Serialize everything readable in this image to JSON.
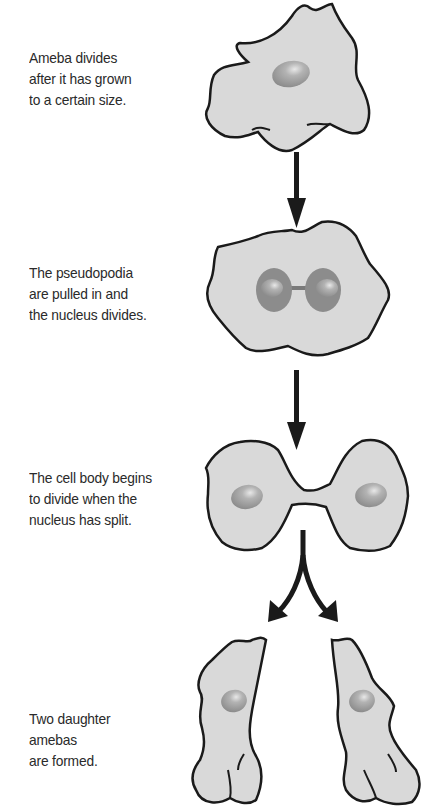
{
  "diagram": {
    "colors": {
      "cell_fill": "#d9d9d9",
      "cell_outline": "#1a1a1a",
      "nucleus": "#9a9a9a",
      "arrow": "#1a1a1a",
      "text": "#2a2a2a",
      "background": "#ffffff"
    },
    "steps": [
      {
        "id": 1,
        "lines": [
          "Ameba divides",
          "after it has grown",
          "to a certain size."
        ],
        "illustration": "ameba with pseudopodia and single nucleus"
      },
      {
        "id": 2,
        "lines": [
          "The pseudopodia",
          "are pulled in and",
          "the nucleus divides."
        ],
        "illustration": "rounded ameba with dividing nucleus (dumbbell shape)"
      },
      {
        "id": 3,
        "lines": [
          "The cell body begins",
          "to divide when the",
          "nucleus has split."
        ],
        "illustration": "pinched cell with two nuclei"
      },
      {
        "id": 4,
        "lines": [
          "Two daughter",
          "amebas",
          "are formed."
        ],
        "illustration": "two separate daughter amebas"
      }
    ],
    "arrows": [
      {
        "from": 1,
        "to": 2,
        "type": "down-arrow"
      },
      {
        "from": 2,
        "to": 3,
        "type": "down-arrow"
      },
      {
        "from": 3,
        "to": 4,
        "type": "split-arrow"
      }
    ]
  }
}
